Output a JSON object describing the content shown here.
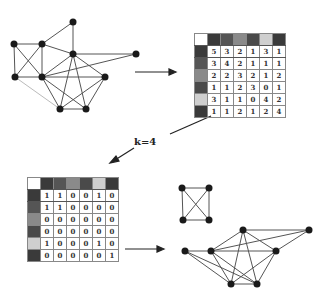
{
  "label": "k=4",
  "colors": {
    "node": "#1a1a1a",
    "edge": "#555555",
    "header": [
      "#ffffff",
      "#3a3a3a",
      "#555555",
      "#8a8a8a",
      "#4a4a4a",
      "#cfcfcf",
      "#3a3a3a"
    ],
    "rowhead": [
      "#3a3a3a",
      "#555555",
      "#8a8a8a",
      "#4a4a4a",
      "#cfcfcf",
      "#3a3a3a"
    ]
  },
  "matrix_top": {
    "rows": [
      [
        "5",
        "3",
        "2",
        "1",
        "3",
        "1"
      ],
      [
        "3",
        "4",
        "2",
        "1",
        "1",
        "1"
      ],
      [
        "2",
        "2",
        "3",
        "2",
        "1",
        "2"
      ],
      [
        "1",
        "1",
        "2",
        "3",
        "0",
        "1"
      ],
      [
        "3",
        "1",
        "1",
        "0",
        "4",
        "2"
      ],
      [
        "1",
        "1",
        "2",
        "1",
        "2",
        "4"
      ]
    ]
  },
  "matrix_bottom": {
    "rows": [
      [
        "1",
        "1",
        "0",
        "0",
        "1",
        "0"
      ],
      [
        "1",
        "1",
        "0",
        "0",
        "0",
        "0"
      ],
      [
        "0",
        "0",
        "0",
        "0",
        "0",
        "0"
      ],
      [
        "0",
        "0",
        "0",
        "0",
        "0",
        "0"
      ],
      [
        "1",
        "0",
        "0",
        "0",
        "1",
        "0"
      ],
      [
        "0",
        "0",
        "0",
        "0",
        "0",
        "1"
      ]
    ]
  }
}
